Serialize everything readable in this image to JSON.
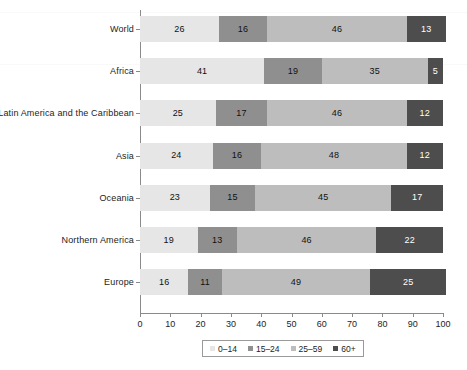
{
  "chart_data": {
    "type": "bar",
    "orientation": "horizontal",
    "stacked": true,
    "stacked_percent": true,
    "title": "",
    "subtitle": "",
    "xlabel": "",
    "ylabel": "",
    "xlim": [
      0,
      100
    ],
    "xticks": [
      0,
      10,
      20,
      30,
      40,
      50,
      60,
      70,
      80,
      90,
      100
    ],
    "xtick_labels": [
      "0",
      "10",
      "20",
      "30",
      "40",
      "50",
      "60",
      "70",
      "80",
      "90",
      "100"
    ],
    "grid": false,
    "legend_position": "bottom",
    "categories": [
      "World",
      "Africa",
      "Latin America and the Caribbean",
      "Asia",
      "Oceania",
      "Northern America",
      "Europe"
    ],
    "series": [
      {
        "name": "0–14",
        "color": "#e6e6e6",
        "values": [
          26,
          41,
          25,
          24,
          23,
          19,
          16
        ]
      },
      {
        "name": "15–24",
        "color": "#8f8f8f",
        "values": [
          16,
          19,
          17,
          16,
          15,
          13,
          11
        ]
      },
      {
        "name": "25–59",
        "color": "#bdbdbd",
        "values": [
          46,
          35,
          46,
          48,
          45,
          46,
          49
        ]
      },
      {
        "name": "60+",
        "color": "#4d4d4d",
        "values": [
          13,
          5,
          12,
          12,
          17,
          22,
          25
        ]
      }
    ],
    "legend_entries": [
      "0–14",
      "15–24",
      "25–59",
      "60+"
    ]
  }
}
